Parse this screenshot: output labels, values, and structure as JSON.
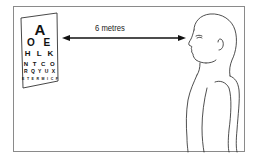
{
  "diagram": {
    "distance_label": "6 metres",
    "eye_chart": {
      "rows": [
        "A",
        "O E",
        "H L K",
        "N T C O",
        "R Q Y U X",
        "E T E R M I C F"
      ]
    },
    "figure": "person-profile-facing-left",
    "colors": {
      "line": "#111111",
      "frame": "#8a8a8a",
      "background": "#ffffff"
    }
  }
}
